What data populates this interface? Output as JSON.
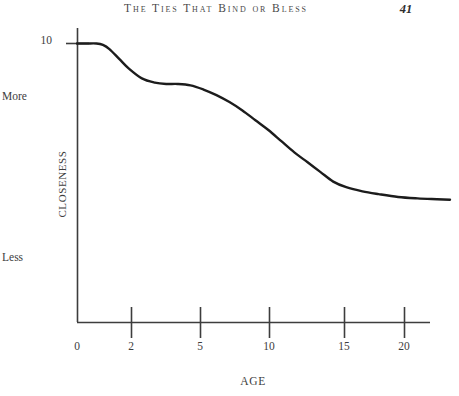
{
  "page": {
    "running_head": "The Ties That Bind or Bless",
    "page_number": "41",
    "background_color": "#ffffff",
    "ink_color": "#3a3a3a"
  },
  "chart_data": {
    "type": "line",
    "title": "",
    "xlabel": "AGE",
    "ylabel": "CLOSENESS",
    "xticks": [
      "0",
      "2",
      "5",
      "10",
      "15",
      "20"
    ],
    "xtick_values": [
      0,
      2,
      5,
      10,
      15,
      20
    ],
    "yticks": [
      "10"
    ],
    "ytick_values": [
      10
    ],
    "y_axis_annotations": [
      "More",
      "Less"
    ],
    "y_more_label": "More",
    "y_less_label": "Less",
    "ylim": [
      0,
      10
    ],
    "xlim": [
      0,
      23
    ],
    "grid": false,
    "legend": null,
    "line_color": "#1c1c1c",
    "line_width": 2.4,
    "series": [
      {
        "name": "Closeness by age",
        "x": [
          0,
          0.6,
          1.2,
          1.6,
          2.0,
          2.6,
          3.2,
          4.0,
          4.8,
          5.5,
          6.2,
          7.0,
          7.8,
          8.6,
          9.4,
          10.2,
          11.0,
          11.8,
          12.6,
          13.4,
          14.2,
          15.0,
          15.8,
          16.6,
          17.6,
          18.6,
          19.8,
          21.0,
          22.2,
          23.0
        ],
        "y": [
          10.0,
          10.0,
          10.0,
          9.95,
          9.8,
          9.45,
          9.1,
          8.75,
          8.6,
          8.55,
          8.55,
          8.5,
          8.35,
          8.15,
          7.9,
          7.6,
          7.25,
          6.9,
          6.5,
          6.1,
          5.75,
          5.4,
          5.05,
          4.85,
          4.7,
          4.6,
          4.5,
          4.45,
          4.42,
          4.4
        ]
      }
    ]
  }
}
